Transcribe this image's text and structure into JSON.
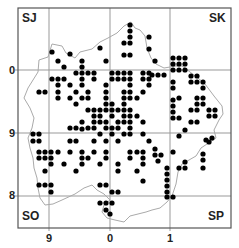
{
  "map": {
    "frame": {
      "x": 18,
      "y": 8,
      "w": 213,
      "h": 220
    },
    "gridlines_x": [
      49,
      110,
      170
    ],
    "gridlines_y": [
      70,
      133,
      196
    ],
    "colors": {
      "frame": "#555555",
      "grid": "#999999",
      "boundary": "#aaaaaa",
      "dot": "#000000"
    },
    "corner_labels": {
      "tl": "SJ",
      "tr": "SK",
      "bl": "SO",
      "br": "SP"
    },
    "y_ticks": [
      {
        "label": "0",
        "y": 70
      },
      {
        "label": "9",
        "y": 133
      },
      {
        "label": "8",
        "y": 196
      }
    ],
    "x_ticks": [
      {
        "label": "9",
        "x": 49
      },
      {
        "label": "0",
        "x": 110
      },
      {
        "label": "1",
        "x": 170
      }
    ],
    "boundary_path": "M39,60 L48,57 L52,44 L62,46 L66,53 L75,58 L80,52 L92,49 L100,42 L108,38 L117,33 L124,26 L131,22 L135,28 L140,30 L145,36 L147,48 L151,58 L156,64 L164,68 L170,67 L176,66 L182,66 L190,72 L198,78 L205,84 L214,96 L222,106 L223,114 L219,120 L214,130 L216,138 L207,144 L201,148 L196,156 L189,160 L182,164 L178,172 L176,184 L172,196 L167,202 L160,208 L152,210 L146,212 L138,214 L130,216 L124,222 L115,220 L107,218 L102,212 L104,205 L110,200 L104,194 L97,190 L92,185 L84,188 L75,194 L62,200 L53,204 L45,205 L40,198 L38,188 L37,178 L34,168 L33,158 L30,148 L28,138 L32,128 L34,118 L30,108 L24,98 L28,88 L33,80 L38,72 Z",
    "dots": [
      [
        130,
        25
      ],
      [
        130,
        31
      ],
      [
        130,
        37
      ],
      [
        149,
        37
      ],
      [
        124,
        43
      ],
      [
        130,
        43
      ],
      [
        100,
        48
      ],
      [
        149,
        49
      ],
      [
        124,
        55
      ],
      [
        130,
        55
      ],
      [
        106,
        61
      ],
      [
        155,
        61
      ],
      [
        52,
        52
      ],
      [
        70,
        54
      ],
      [
        58,
        61
      ],
      [
        82,
        61
      ],
      [
        64,
        67
      ],
      [
        82,
        67
      ],
      [
        82,
        73
      ],
      [
        76,
        73
      ],
      [
        88,
        73
      ],
      [
        94,
        73
      ],
      [
        112,
        73
      ],
      [
        118,
        73
      ],
      [
        124,
        73
      ],
      [
        130,
        73
      ],
      [
        143,
        73
      ],
      [
        149,
        73
      ],
      [
        58,
        79
      ],
      [
        52,
        79
      ],
      [
        64,
        79
      ],
      [
        82,
        79
      ],
      [
        94,
        79
      ],
      [
        112,
        79
      ],
      [
        118,
        79
      ],
      [
        124,
        79
      ],
      [
        130,
        79
      ],
      [
        149,
        79
      ],
      [
        143,
        79
      ],
      [
        58,
        85
      ],
      [
        70,
        85
      ],
      [
        82,
        85
      ],
      [
        106,
        85
      ],
      [
        130,
        85
      ],
      [
        149,
        85
      ],
      [
        39,
        92
      ],
      [
        45,
        92
      ],
      [
        58,
        92
      ],
      [
        76,
        92
      ],
      [
        88,
        92
      ],
      [
        106,
        92
      ],
      [
        124,
        92
      ],
      [
        130,
        92
      ],
      [
        143,
        92
      ],
      [
        58,
        98
      ],
      [
        70,
        98
      ],
      [
        82,
        98
      ],
      [
        88,
        98
      ],
      [
        106,
        98
      ],
      [
        124,
        98
      ],
      [
        130,
        98
      ],
      [
        137,
        98
      ],
      [
        76,
        104
      ],
      [
        106,
        104
      ],
      [
        124,
        104
      ],
      [
        112,
        104
      ],
      [
        88,
        110
      ],
      [
        94,
        110
      ],
      [
        100,
        110
      ],
      [
        106,
        110
      ],
      [
        112,
        110
      ],
      [
        118,
        110
      ],
      [
        124,
        110
      ],
      [
        130,
        110
      ],
      [
        94,
        116
      ],
      [
        100,
        116
      ],
      [
        112,
        116
      ],
      [
        124,
        116
      ],
      [
        130,
        116
      ],
      [
        137,
        116
      ],
      [
        82,
        122
      ],
      [
        100,
        122
      ],
      [
        106,
        122
      ],
      [
        118,
        122
      ],
      [
        124,
        122
      ],
      [
        130,
        122
      ],
      [
        143,
        122
      ],
      [
        70,
        128
      ],
      [
        76,
        128
      ],
      [
        88,
        128
      ],
      [
        94,
        128
      ],
      [
        106,
        128
      ],
      [
        112,
        128
      ],
      [
        118,
        128
      ],
      [
        130,
        128
      ],
      [
        94,
        122
      ],
      [
        33,
        134
      ],
      [
        39,
        134
      ],
      [
        82,
        129
      ],
      [
        100,
        134
      ],
      [
        112,
        134
      ],
      [
        124,
        134
      ],
      [
        130,
        134
      ],
      [
        143,
        134
      ],
      [
        33,
        141
      ],
      [
        39,
        141
      ],
      [
        70,
        141
      ],
      [
        76,
        141
      ],
      [
        94,
        141
      ],
      [
        106,
        141
      ],
      [
        118,
        141
      ],
      [
        149,
        141
      ],
      [
        39,
        152
      ],
      [
        45,
        152
      ],
      [
        51,
        152
      ],
      [
        58,
        152
      ],
      [
        70,
        152
      ],
      [
        82,
        152
      ],
      [
        94,
        152
      ],
      [
        106,
        152
      ],
      [
        130,
        152
      ],
      [
        137,
        152
      ],
      [
        143,
        152
      ],
      [
        39,
        158
      ],
      [
        45,
        158
      ],
      [
        51,
        158
      ],
      [
        82,
        158
      ],
      [
        88,
        158
      ],
      [
        106,
        158
      ],
      [
        130,
        158
      ],
      [
        143,
        158
      ],
      [
        51,
        164
      ],
      [
        64,
        164
      ],
      [
        82,
        164
      ],
      [
        100,
        164
      ],
      [
        118,
        164
      ],
      [
        143,
        164
      ],
      [
        45,
        171
      ],
      [
        76,
        171
      ],
      [
        118,
        171
      ],
      [
        137,
        171
      ],
      [
        39,
        185
      ],
      [
        45,
        185
      ],
      [
        51,
        185
      ],
      [
        100,
        185
      ],
      [
        106,
        185
      ],
      [
        143,
        181
      ],
      [
        51,
        192
      ],
      [
        112,
        192
      ],
      [
        118,
        192
      ],
      [
        167,
        192
      ],
      [
        100,
        203
      ],
      [
        106,
        203
      ],
      [
        112,
        203
      ],
      [
        167,
        197
      ],
      [
        173,
        197
      ],
      [
        106,
        210
      ],
      [
        110,
        214
      ],
      [
        167,
        180
      ],
      [
        167,
        186
      ],
      [
        167,
        174
      ],
      [
        152,
        75
      ],
      [
        158,
        75
      ],
      [
        164,
        75
      ],
      [
        173,
        70
      ],
      [
        179,
        70
      ],
      [
        185,
        70
      ],
      [
        173,
        64
      ],
      [
        179,
        64
      ],
      [
        185,
        64
      ],
      [
        173,
        58
      ],
      [
        185,
        58
      ],
      [
        179,
        58
      ],
      [
        191,
        76
      ],
      [
        197,
        76
      ],
      [
        191,
        82
      ],
      [
        197,
        82
      ],
      [
        203,
        82
      ],
      [
        203,
        88
      ],
      [
        173,
        82
      ],
      [
        173,
        88
      ],
      [
        173,
        100
      ],
      [
        173,
        106
      ],
      [
        179,
        98
      ],
      [
        197,
        98
      ],
      [
        203,
        98
      ],
      [
        197,
        104
      ],
      [
        203,
        104
      ],
      [
        191,
        110
      ],
      [
        197,
        110
      ],
      [
        209,
        110
      ],
      [
        215,
        110
      ],
      [
        209,
        116
      ],
      [
        215,
        116
      ],
      [
        173,
        112
      ],
      [
        173,
        118
      ],
      [
        179,
        118
      ],
      [
        191,
        122
      ],
      [
        197,
        122
      ],
      [
        185,
        130
      ],
      [
        179,
        136
      ],
      [
        206,
        140
      ],
      [
        212,
        138
      ],
      [
        209,
        142
      ],
      [
        155,
        149
      ],
      [
        155,
        155
      ],
      [
        161,
        155
      ],
      [
        158,
        161
      ],
      [
        173,
        152
      ],
      [
        185,
        162
      ],
      [
        203,
        154
      ],
      [
        203,
        160
      ],
      [
        167,
        168
      ],
      [
        179,
        168
      ],
      [
        185,
        168
      ],
      [
        203,
        168
      ]
    ]
  }
}
